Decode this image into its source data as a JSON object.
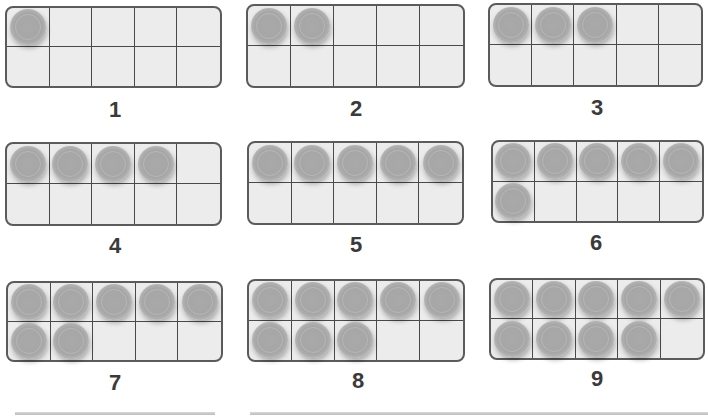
{
  "colors": {
    "frame_border": "#5b5b5b",
    "frame_fill": "#ececec",
    "counter": "#a8a8a8",
    "label": "#3a3a3a"
  },
  "frames": [
    {
      "label": "1",
      "count": 1,
      "x": 5,
      "y": 6,
      "w": 217,
      "h": 82,
      "lx": 95,
      "ly": 97
    },
    {
      "label": "2",
      "count": 2,
      "x": 246,
      "y": 4,
      "w": 219,
      "h": 84,
      "lx": 336,
      "ly": 96
    },
    {
      "label": "3",
      "count": 3,
      "x": 488,
      "y": 3,
      "w": 215,
      "h": 84,
      "lx": 577,
      "ly": 95
    },
    {
      "label": "4",
      "count": 4,
      "x": 5,
      "y": 142,
      "w": 217,
      "h": 84,
      "lx": 95,
      "ly": 233
    },
    {
      "label": "5",
      "count": 5,
      "x": 247,
      "y": 141,
      "w": 217,
      "h": 84,
      "lx": 336,
      "ly": 232
    },
    {
      "label": "6",
      "count": 6,
      "x": 491,
      "y": 140,
      "w": 213,
      "h": 83,
      "lx": 576,
      "ly": 230
    },
    {
      "label": "7",
      "count": 7,
      "x": 6,
      "y": 281,
      "w": 217,
      "h": 81,
      "lx": 95,
      "ly": 370
    },
    {
      "label": "8",
      "count": 8,
      "x": 247,
      "y": 279,
      "w": 218,
      "h": 83,
      "lx": 338,
      "ly": 368
    },
    {
      "label": "9",
      "count": 9,
      "x": 489,
      "y": 278,
      "w": 216,
      "h": 82,
      "lx": 577,
      "ly": 366
    }
  ],
  "rules": [
    {
      "x": 15,
      "w": 200
    },
    {
      "x": 250,
      "w": 458
    }
  ]
}
